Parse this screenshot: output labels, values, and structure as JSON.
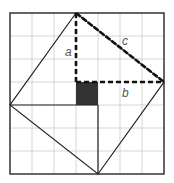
{
  "diagram": {
    "grid": {
      "cols": 7,
      "rows": 7,
      "origin_px": [
        10,
        13
      ],
      "cell_px": 22,
      "line_color": "#cccccc"
    },
    "frame": {
      "color": "#333333"
    },
    "outer_square_vertices_grid": [
      [
        3,
        0
      ],
      [
        7,
        3
      ],
      [
        4,
        7
      ],
      [
        0,
        4
      ]
    ],
    "inner_square_grid": {
      "x": 3,
      "y": 3,
      "size": 1,
      "fill": "#333333"
    },
    "dashed_segments": [
      {
        "name": "a",
        "from": [
          3,
          0
        ],
        "to": [
          3,
          3
        ]
      },
      {
        "name": "b",
        "from": [
          3,
          3
        ],
        "to": [
          7,
          3
        ]
      },
      {
        "name": "c",
        "from": [
          3,
          0
        ],
        "to": [
          7,
          3
        ]
      }
    ],
    "solid_segments": [
      {
        "from": [
          0,
          4
        ],
        "to": [
          4,
          4
        ]
      },
      {
        "from": [
          4,
          4
        ],
        "to": [
          4,
          7
        ]
      }
    ],
    "labels": {
      "a": "a",
      "b": "b",
      "c": "c"
    },
    "colors": {
      "line": "#222222",
      "label": "#555555"
    }
  }
}
